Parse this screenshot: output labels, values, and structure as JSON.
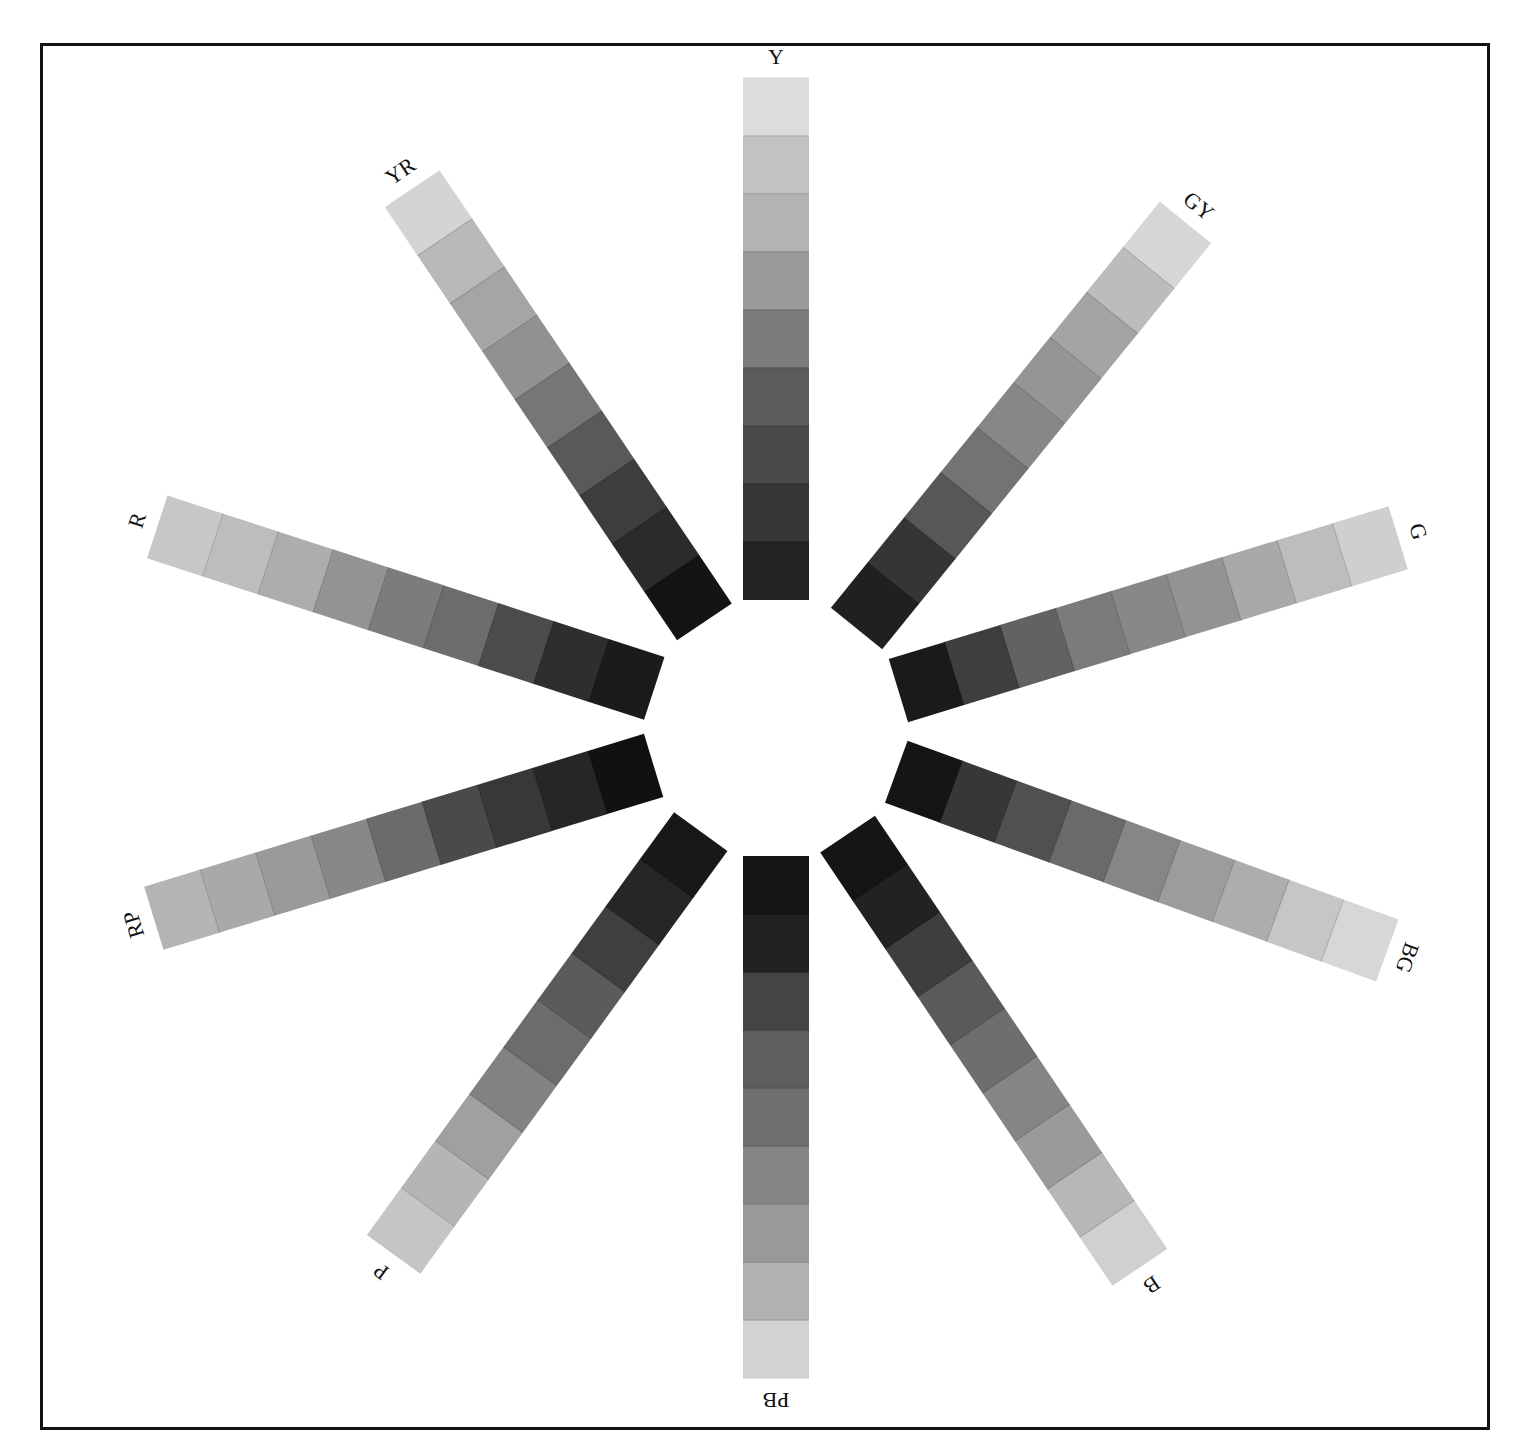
{
  "figure": {
    "center_gap": "empty white circle"
  },
  "hues": [
    {
      "label": "Y",
      "angle_deg": -90,
      "steps": [
        "#dcdcdc",
        "#c2c2c2",
        "#b3b3b3",
        "#9a9a9a",
        "#7c7c7c",
        "#5c5c5c",
        "#4a4a4a",
        "#363636",
        "#232323"
      ]
    },
    {
      "label": "GY",
      "angle_deg": -51,
      "steps": [
        "#d6d6d6",
        "#bcbcbc",
        "#a4a4a4",
        "#959595",
        "#878787",
        "#737373",
        "#575757",
        "#353535",
        "#202020"
      ]
    },
    {
      "label": "G",
      "angle_deg": -17,
      "steps": [
        "#cfcfcf",
        "#bdbdbd",
        "#a9a9a9",
        "#939393",
        "#888888",
        "#7b7b7b",
        "#626262",
        "#3e3e3e",
        "#1a1a1a"
      ]
    },
    {
      "label": "BG",
      "angle_deg": 20,
      "steps": [
        "#d7d7d7",
        "#c6c6c6",
        "#adadad",
        "#9c9c9c",
        "#868686",
        "#6a6a6a",
        "#505050",
        "#373737",
        "#151515"
      ]
    },
    {
      "label": "B",
      "angle_deg": 56,
      "steps": [
        "#d0d0d0",
        "#b7b7b7",
        "#9a9a9a",
        "#858585",
        "#6e6e6e",
        "#5a5a5a",
        "#3e3e3e",
        "#222222",
        "#151515"
      ]
    },
    {
      "label": "PB",
      "angle_deg": 90,
      "steps": [
        "#d2d2d2",
        "#b1b1b1",
        "#999999",
        "#858585",
        "#707070",
        "#5e5e5e",
        "#444444",
        "#222222",
        "#151515"
      ]
    },
    {
      "label": "P",
      "angle_deg": 126,
      "steps": [
        "#c5c5c5",
        "#b5b5b5",
        "#a0a0a0",
        "#828282",
        "#6c6c6c",
        "#5b5b5b",
        "#3f3f3f",
        "#262626",
        "#181818"
      ]
    },
    {
      "label": "RP",
      "angle_deg": 163,
      "steps": [
        "#b4b4b4",
        "#a9a9a9",
        "#9a9a9a",
        "#888888",
        "#6b6b6b",
        "#4a4a4a",
        "#383838",
        "#262626",
        "#111111"
      ]
    },
    {
      "label": "R",
      "angle_deg": -162,
      "steps": [
        "#c7c7c7",
        "#bdbdbd",
        "#adadad",
        "#939393",
        "#7c7c7c",
        "#6c6c6c",
        "#4b4b4b",
        "#2e2e2e",
        "#1b1b1b"
      ]
    },
    {
      "label": "YR",
      "angle_deg": -124,
      "steps": [
        "#d4d4d4",
        "#b9b9b9",
        "#a5a5a5",
        "#919191",
        "#767676",
        "#595959",
        "#3d3d3d",
        "#2b2b2b",
        "#141414"
      ]
    }
  ],
  "colors": {
    "frame": "#111111",
    "background": "#ffffff",
    "label": "#111111"
  }
}
